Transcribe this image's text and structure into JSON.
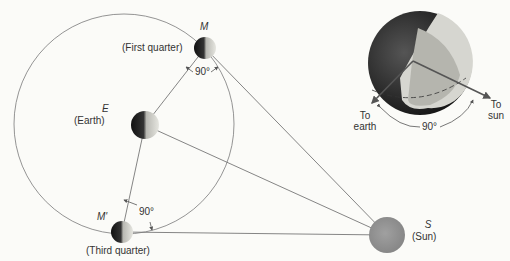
{
  "bodies": {
    "moon_first": {
      "symbol": "M",
      "label": "(First quarter)"
    },
    "earth": {
      "symbol": "E",
      "label": "(Earth)"
    },
    "moon_third": {
      "symbol": "M'",
      "label": "(Third quarter)"
    },
    "sun": {
      "symbol": "S",
      "label": "(Sun)"
    }
  },
  "angles": {
    "first_quarter": "90°",
    "third_quarter": "90°",
    "inset": "90°"
  },
  "inset": {
    "to_earth_line1": "To",
    "to_earth_line2": "earth",
    "to_sun_line1": "To",
    "to_sun_line2": "sun"
  },
  "colors": {
    "background": "#fbfbf8",
    "line": "#7a7a7a",
    "sun": "#8f8f8f",
    "dark_side": "#1a1a1a",
    "lit_side": "#d8d8d2"
  }
}
